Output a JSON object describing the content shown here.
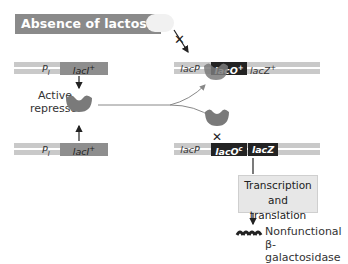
{
  "title": "Absence of lactose",
  "left_genes": [
    {
      "promoter": "P",
      "promoter_sub": "I",
      "gene": "lacI",
      "gene_sup": "+"
    },
    {
      "promoter": "P",
      "promoter_sub": "I",
      "gene": "lacI",
      "gene_sup": "+"
    }
  ],
  "repressor_label": [
    "Active",
    "repressor"
  ],
  "top_operon": {
    "promoter": "lacP",
    "operator": "lacO",
    "operator_sup": "+",
    "gene": "lacZ",
    "gene_sup": "+"
  },
  "bottom_operon": {
    "promoter": "lacP",
    "operator": "lacO",
    "operator_sup": "c",
    "gene": "lacZ"
  },
  "process_box": [
    "Transcription",
    "and translation"
  ],
  "product_label": [
    "Nonfunctional",
    "β-galactosidase"
  ],
  "blocked_mark": "✕",
  "colors": {
    "strand": "#c9c9c9",
    "gene_dark": "#8e8e8e",
    "operator": "#232323",
    "repressor": "#7a7a7a",
    "title_bg": "#8a8a8a"
  }
}
